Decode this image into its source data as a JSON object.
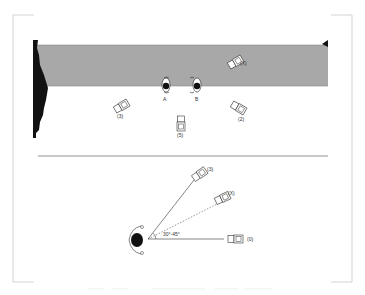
{
  "figure": {
    "top_panel": {
      "subjects": [
        {
          "id": "A",
          "label": "A"
        },
        {
          "id": "B",
          "label": "B"
        }
      ],
      "cameras": [
        {
          "id": "cam-x-top",
          "label": "(X)"
        },
        {
          "id": "cam-left",
          "label": "(3)"
        },
        {
          "id": "cam-center",
          "label": "(5)"
        },
        {
          "id": "cam-right",
          "label": "(2)"
        }
      ]
    },
    "bottom_panel": {
      "cameras": [
        {
          "id": "cam-upper",
          "label": "(3)"
        },
        {
          "id": "cam-x",
          "label": "(X)"
        },
        {
          "id": "cam-straight",
          "label": "(0)"
        }
      ],
      "angle_label": "30°-45°"
    }
  },
  "colors": {
    "band": "#a8a8a8",
    "ink": "#1a1a1a",
    "frame": "#c8c8c8",
    "divider": "#777777"
  }
}
